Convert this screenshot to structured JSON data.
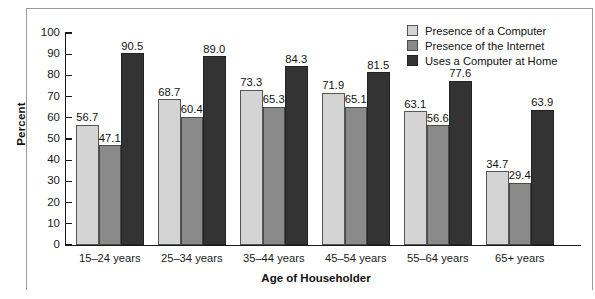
{
  "chart_data": {
    "type": "bar",
    "title": "",
    "xlabel": "Age of Householder",
    "ylabel": "Percent",
    "ylim": [
      0,
      100
    ],
    "ytick_step": 10,
    "yticks": [
      0,
      10,
      20,
      30,
      40,
      50,
      60,
      70,
      80,
      90,
      100
    ],
    "grid": false,
    "legend_position": "top-right",
    "categories": [
      "15–24 years",
      "25–34 years",
      "35–44 years",
      "45–54 years",
      "55–64 years",
      "65+ years"
    ],
    "series": [
      {
        "name": "Presence of a Computer",
        "color": "#d4d4d4",
        "values": [
          56.7,
          68.7,
          73.3,
          71.9,
          63.1,
          34.7
        ]
      },
      {
        "name": "Presence of the Internet",
        "color": "#8a8a8a",
        "values": [
          47.1,
          60.4,
          65.3,
          65.1,
          56.6,
          29.4
        ]
      },
      {
        "name": "Uses a Computer at Home",
        "color": "#333333",
        "values": [
          90.5,
          89.0,
          84.3,
          81.5,
          77.6,
          63.9
        ]
      }
    ],
    "value_labels": [
      [
        "56.7",
        "47.1",
        "90.5"
      ],
      [
        "68.7",
        "60.4",
        "89.0"
      ],
      [
        "73.3",
        "65.3",
        "84.3"
      ],
      [
        "71.9",
        "65.1",
        "81.5"
      ],
      [
        "63.1",
        "56.6",
        "77.6"
      ],
      [
        "34.7",
        "29.4",
        "63.9"
      ]
    ]
  },
  "legend": {
    "items": [
      {
        "label": "Presence of a Computer"
      },
      {
        "label": "Presence of the Internet"
      },
      {
        "label": "Uses a Computer at Home"
      }
    ]
  }
}
